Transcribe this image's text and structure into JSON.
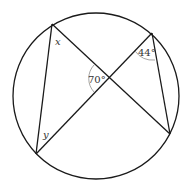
{
  "diagram": {
    "labels": {
      "x": "x",
      "y": "y",
      "angle_center": "70°",
      "angle_top_right": "44°"
    },
    "colors": {
      "stroke": "#1a1a1a",
      "arc": "#9a9a9a",
      "text": "#333333"
    }
  }
}
